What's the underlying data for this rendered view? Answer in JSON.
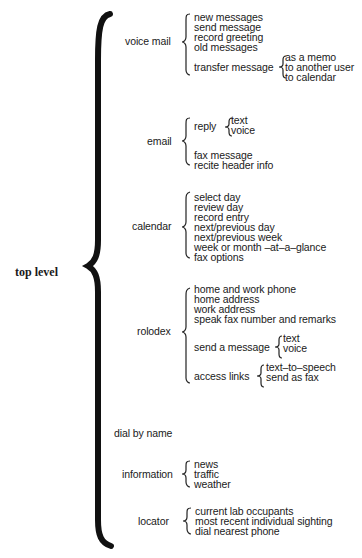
{
  "root": "top level",
  "branches": [
    {
      "label": "voice mail",
      "items": [
        "new messages",
        "send message",
        "record greeting",
        "old messages"
      ],
      "sub": {
        "label": "transfer message",
        "items": [
          "as a memo",
          "to another user",
          "to calendar"
        ]
      }
    },
    {
      "label": "email",
      "reply": {
        "label": "reply",
        "items": [
          "text",
          "voice"
        ]
      },
      "items": [
        "fax message",
        "recite header info"
      ]
    },
    {
      "label": "calendar",
      "items": [
        "select day",
        "review day",
        "record entry",
        "next/previous day",
        "next/previous week",
        "week or month –at–a–glance",
        "fax options"
      ]
    },
    {
      "label": "rolodex",
      "items": [
        "home and work phone",
        "home address",
        "work address",
        "speak fax number and remarks"
      ],
      "send": {
        "label": "send a message",
        "items": [
          "text",
          "voice"
        ]
      },
      "access": {
        "label": "access links",
        "items": [
          "text–to–speech",
          "send as fax"
        ]
      }
    },
    {
      "label": "dial by name"
    },
    {
      "label": "information",
      "items": [
        "news",
        "traffic",
        "weather"
      ]
    },
    {
      "label": "locator",
      "items": [
        "current lab occupants",
        "most recent individual sighting",
        "dial nearest phone"
      ]
    }
  ]
}
